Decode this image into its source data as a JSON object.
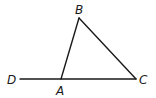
{
  "diagram": {
    "type": "geometry-triangle",
    "points": {
      "A": {
        "label": "A",
        "x": 61,
        "y": 79
      },
      "B": {
        "label": "B",
        "x": 79,
        "y": 18
      },
      "C": {
        "label": "C",
        "x": 136,
        "y": 79
      },
      "D": {
        "label": "D",
        "x": 20,
        "y": 79
      }
    },
    "segments": [
      {
        "from": "D",
        "to": "C"
      },
      {
        "from": "A",
        "to": "B"
      },
      {
        "from": "B",
        "to": "C"
      }
    ],
    "labels": {
      "A": "A",
      "B": "B",
      "C": "C",
      "D": "D"
    },
    "color": "#1a1a1a"
  }
}
